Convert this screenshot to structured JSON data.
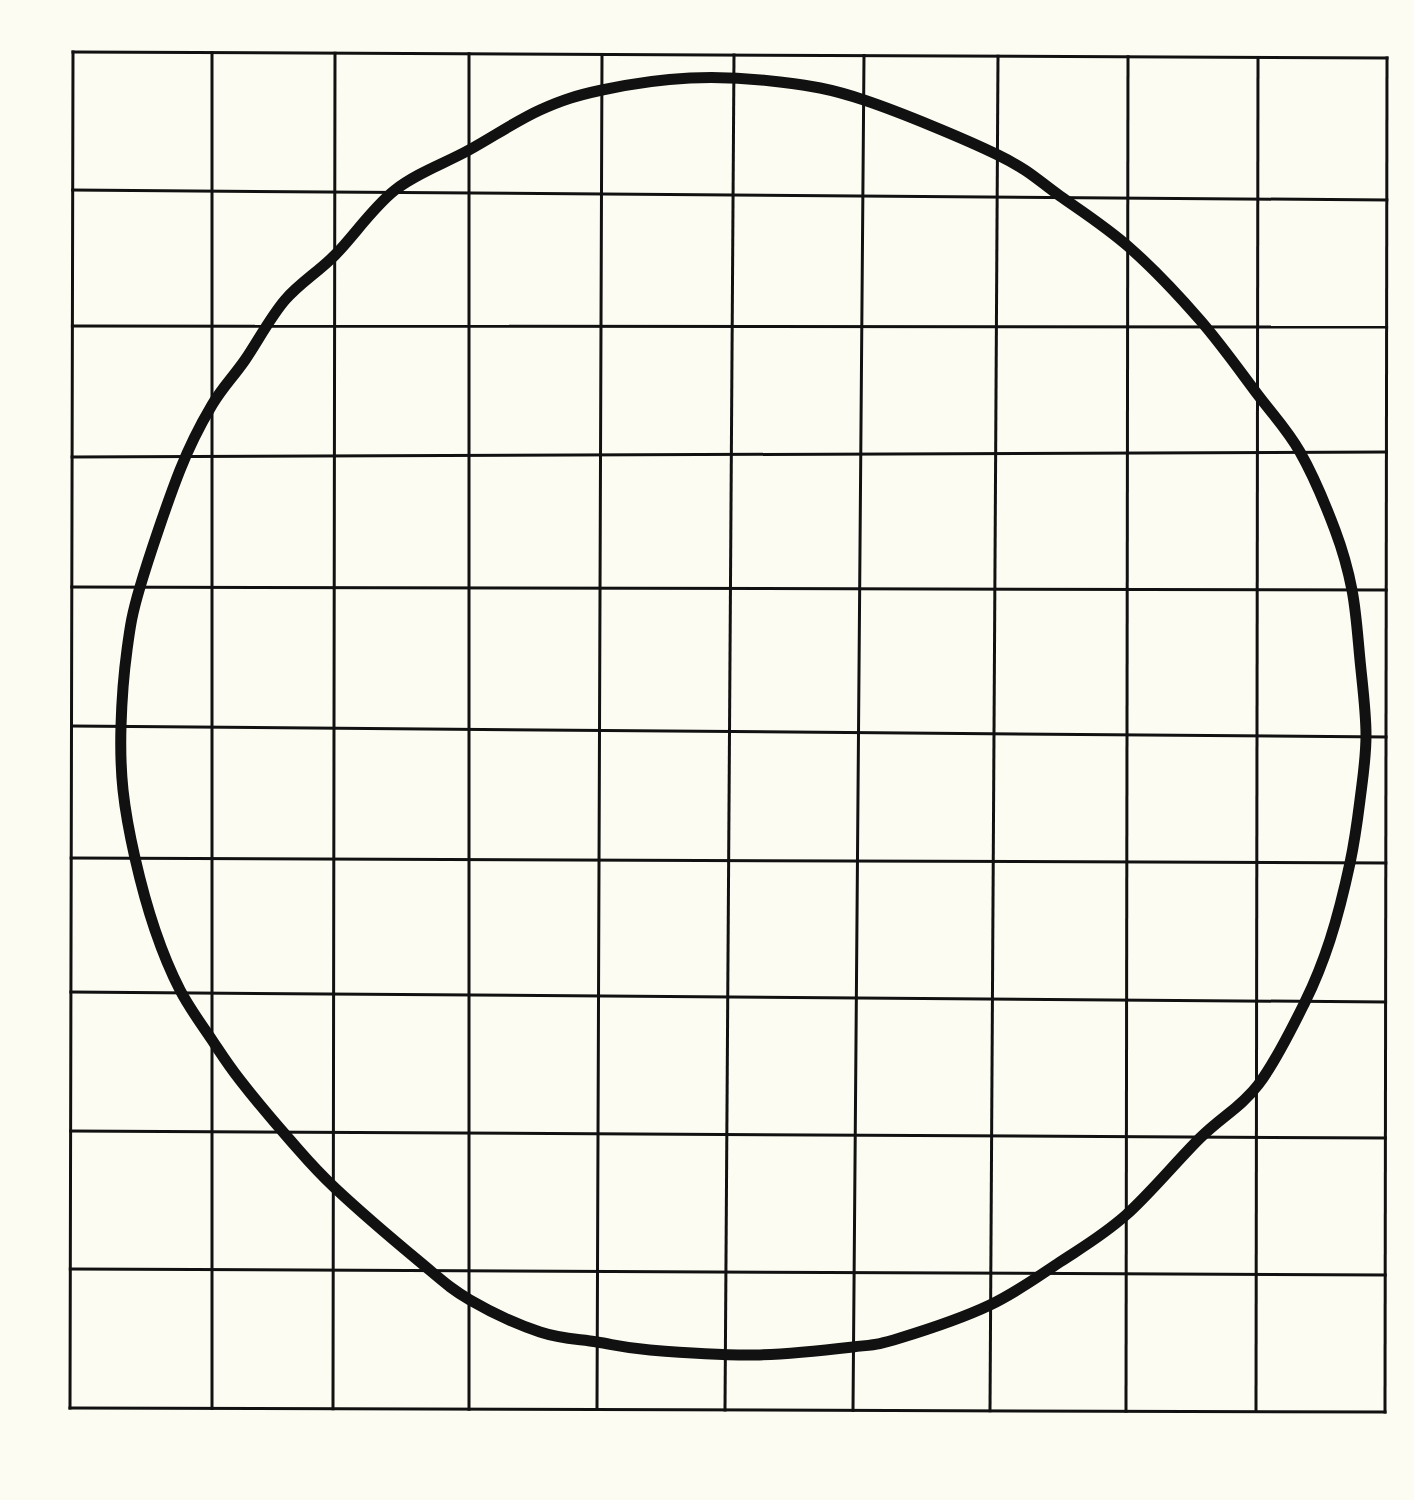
{
  "canvas": {
    "width": 1414,
    "height": 1500,
    "background": "#fdfcf3",
    "ink": "#111111"
  },
  "grid": {
    "columns": 10,
    "rows": 10,
    "top_edge_y": [
      52,
      58
    ],
    "bottom_edge_y": [
      1408,
      1412
    ],
    "left_edge_x": [
      73,
      70
    ],
    "right_edge_x": [
      1387,
      1385
    ],
    "vertical_lines": [
      {
        "x_top": 73,
        "x_bottom": 70
      },
      {
        "x_top": 212,
        "x_bottom": 212
      },
      {
        "x_top": 335,
        "x_bottom": 333
      },
      {
        "x_top": 469,
        "x_bottom": 469
      },
      {
        "x_top": 602,
        "x_bottom": 597
      },
      {
        "x_top": 734,
        "x_bottom": 725
      },
      {
        "x_top": 864,
        "x_bottom": 853
      },
      {
        "x_top": 998,
        "x_bottom": 990
      },
      {
        "x_top": 1128,
        "x_bottom": 1126
      },
      {
        "x_top": 1258,
        "x_bottom": 1256
      },
      {
        "x_top": 1387,
        "x_bottom": 1385
      }
    ],
    "horizontal_lines": [
      {
        "y_left": 52,
        "y_right": 58
      },
      {
        "y_left": 190,
        "y_right": 200
      },
      {
        "y_left": 326,
        "y_right": 327
      },
      {
        "y_left": 457,
        "y_right": 452
      },
      {
        "y_left": 587,
        "y_right": 590
      },
      {
        "y_left": 726,
        "y_right": 737
      },
      {
        "y_left": 858,
        "y_right": 863
      },
      {
        "y_left": 992,
        "y_right": 1002
      },
      {
        "y_left": 1131,
        "y_right": 1138
      },
      {
        "y_left": 1269,
        "y_right": 1275
      },
      {
        "y_left": 1408,
        "y_right": 1412
      }
    ]
  },
  "shape": {
    "type": "irregular-closed-curve",
    "description": "Hand-drawn roughly circular blob overlaid on grid",
    "extremes": {
      "top": [
        690,
        78
      ],
      "bottom": [
        755,
        1355
      ],
      "left": [
        121,
        726
      ],
      "right": [
        1366,
        735
      ]
    },
    "path_points": [
      [
        690,
        78
      ],
      [
        780,
        82
      ],
      [
        864,
        100
      ],
      [
        998,
        155
      ],
      [
        1060,
        196
      ],
      [
        1130,
        248
      ],
      [
        1200,
        320
      ],
      [
        1258,
        395
      ],
      [
        1300,
        452
      ],
      [
        1335,
        530
      ],
      [
        1352,
        590
      ],
      [
        1360,
        660
      ],
      [
        1366,
        735
      ],
      [
        1360,
        800
      ],
      [
        1350,
        863
      ],
      [
        1330,
        940
      ],
      [
        1305,
        1002
      ],
      [
        1258,
        1085
      ],
      [
        1200,
        1138
      ],
      [
        1126,
        1215
      ],
      [
        1060,
        1262
      ],
      [
        990,
        1305
      ],
      [
        900,
        1338
      ],
      [
        853,
        1347
      ],
      [
        755,
        1355
      ],
      [
        650,
        1350
      ],
      [
        597,
        1342
      ],
      [
        540,
        1332
      ],
      [
        470,
        1300
      ],
      [
        420,
        1262
      ],
      [
        335,
        1188
      ],
      [
        290,
        1140
      ],
      [
        240,
        1080
      ],
      [
        212,
        1040
      ],
      [
        180,
        990
      ],
      [
        155,
        930
      ],
      [
        135,
        858
      ],
      [
        123,
        790
      ],
      [
        121,
        726
      ],
      [
        127,
        650
      ],
      [
        140,
        587
      ],
      [
        180,
        470
      ],
      [
        212,
        405
      ],
      [
        245,
        360
      ],
      [
        285,
        300
      ],
      [
        335,
        255
      ],
      [
        395,
        190
      ],
      [
        469,
        150
      ],
      [
        540,
        110
      ],
      [
        602,
        90
      ],
      [
        690,
        78
      ]
    ]
  }
}
